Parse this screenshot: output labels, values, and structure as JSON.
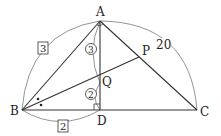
{
  "points": {
    "A": {
      "label": "A",
      "x": 100,
      "y": 21
    },
    "B": {
      "label": "B",
      "x": 22,
      "y": 110
    },
    "C": {
      "label": "C",
      "x": 197,
      "y": 110
    },
    "D": {
      "label": "D",
      "x": 100,
      "y": 110
    },
    "P": {
      "label": "P",
      "x": 139,
      "y": 57
    },
    "Q": {
      "label": "Q",
      "x": 100,
      "y": 83
    }
  },
  "annotations": {
    "AB_length": "3",
    "BD_length": "2",
    "AQ_ratio": "3",
    "QD_ratio": "2",
    "AC_length": "20"
  },
  "colors": {
    "line": "#333333",
    "arc": "#777777"
  }
}
